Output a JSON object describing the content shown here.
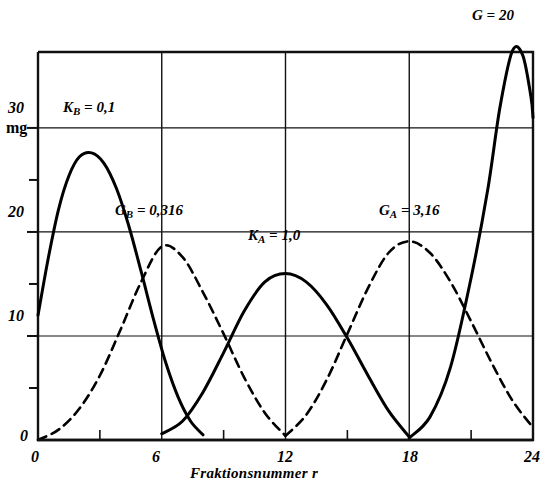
{
  "figure": {
    "background_color": "#ffffff",
    "ink_color": "#000000"
  },
  "axis": {
    "x_title": "Fraktionsnummer r",
    "y_unit": "mg",
    "x_ticks": [
      "0",
      "6",
      "12",
      "18",
      "24"
    ],
    "y_ticks": [
      "0",
      "10",
      "20",
      "30"
    ],
    "origin_label": "0"
  },
  "labels": {
    "kb": {
      "symbol": "K",
      "sub": "B",
      "value": "= 0,1"
    },
    "gb": {
      "symbol": "G",
      "sub": "B",
      "value": "= 0,316"
    },
    "ka": {
      "symbol": "K",
      "sub": "A",
      "value": "= 1,0"
    },
    "ga": {
      "symbol": "G",
      "sub": "A",
      "value": "= 3,16"
    },
    "g20": {
      "symbol": "G",
      "sub": "",
      "value": "= 20"
    }
  },
  "chart_data": {
    "type": "line",
    "title": "",
    "xlabel": "Fraktionsnummer r",
    "ylabel": "mg",
    "xlim": [
      0,
      24
    ],
    "ylim": [
      0,
      37.3
    ],
    "grid": true,
    "legend": "inline-annotations",
    "x_major_ticks": [
      0,
      6,
      12,
      18,
      24
    ],
    "x_minor_ticks": [
      3,
      9,
      15,
      21
    ],
    "y_major_ticks": [
      0,
      10,
      20,
      30
    ],
    "y_minor_ticks": [
      5,
      15,
      25
    ],
    "series": [
      {
        "name": "K_B = 0,1",
        "style": "solid",
        "annotation": "K_B = 0,1",
        "peak_x": 2.6,
        "peak_y": 27.6,
        "x": [
          0,
          0.5,
          1,
          1.5,
          2,
          2.6,
          3.2,
          3.8,
          4.4,
          5,
          5.6,
          6.2,
          6.8,
          7.4,
          8
        ],
        "values": [
          12.0,
          17.5,
          22.2,
          25.4,
          27.2,
          27.6,
          26.6,
          24.2,
          20.6,
          16.2,
          11.6,
          7.4,
          4.1,
          1.8,
          0.5
        ]
      },
      {
        "name": "G_B = 0,316",
        "style": "dashed",
        "annotation": "G_B = 0,316",
        "peak_x": 6.0,
        "peak_y": 18.6,
        "x": [
          0,
          1,
          2,
          3,
          4,
          5,
          6,
          7,
          8,
          9,
          10,
          11,
          12
        ],
        "values": [
          0.0,
          1.0,
          3.0,
          6.2,
          10.6,
          15.2,
          18.6,
          17.6,
          14.2,
          10.2,
          6.0,
          2.6,
          0.4
        ]
      },
      {
        "name": "K_A = 1,0",
        "style": "solid",
        "annotation": "K_A = 1,0",
        "peak_x": 12.0,
        "peak_y": 16.0,
        "x": [
          6,
          7,
          8,
          9,
          10,
          11,
          12,
          13,
          14,
          15,
          16,
          17,
          18
        ],
        "values": [
          0.6,
          1.8,
          4.6,
          8.4,
          12.4,
          15.2,
          16.0,
          15.2,
          13.0,
          9.8,
          6.2,
          2.8,
          0.3
        ]
      },
      {
        "name": "G_A = 3,16",
        "style": "dashed",
        "annotation": "G_A = 3,16",
        "peak_x": 18.0,
        "peak_y": 19.1,
        "x": [
          12,
          13,
          14,
          15,
          16,
          17,
          18,
          19,
          20,
          21,
          22,
          23,
          24
        ],
        "values": [
          0.4,
          2.4,
          5.8,
          10.2,
          14.6,
          18.0,
          19.1,
          18.0,
          15.2,
          11.4,
          7.4,
          3.8,
          1.2
        ]
      },
      {
        "name": "G = 20",
        "style": "solid",
        "annotation": "G = 20",
        "peak_x": 23.0,
        "peak_y": 37.6,
        "x": [
          18,
          19,
          20,
          21,
          21.8,
          22.4,
          23.0,
          23.5,
          23.9,
          24
        ],
        "values": [
          0.2,
          2.2,
          7.0,
          15.6,
          24.0,
          32.0,
          37.4,
          37.0,
          33.0,
          31.0
        ]
      }
    ]
  }
}
